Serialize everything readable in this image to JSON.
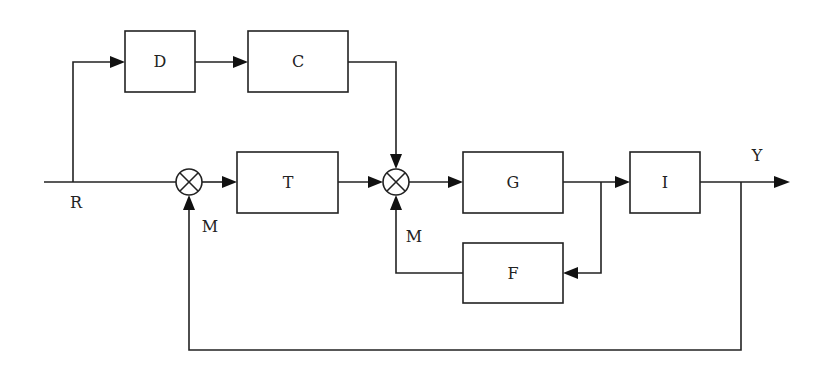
{
  "diagram": {
    "type": "control-system-block-diagram",
    "blocks": {
      "D": "D",
      "C": "C",
      "T": "T",
      "G": "G",
      "I": "I",
      "F": "F"
    },
    "signals": {
      "input": "R",
      "output": "Y",
      "feedback_outer": "M",
      "feedback_inner": "M"
    },
    "summing_junctions": [
      "sum-1",
      "sum-2"
    ],
    "colors": {
      "stroke": "#222222",
      "background": "#ffffff"
    }
  }
}
